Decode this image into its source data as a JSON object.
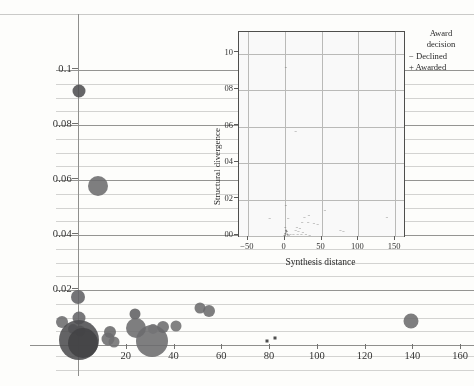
{
  "chart_data": [
    {
      "type": "scatter",
      "name": "main-bubble-chart",
      "title": "",
      "xlabel": "",
      "ylabel": "",
      "xlim": [
        -8,
        168
      ],
      "ylim": [
        0.0,
        0.104
      ],
      "grid": true,
      "xticks": [
        20,
        40,
        60,
        80,
        100,
        120,
        140,
        160
      ],
      "yticks": [
        0.02,
        0.04,
        0.06,
        0.08,
        0.1
      ],
      "ytick_labels": [
        "0.02",
        "0.04",
        "0.06",
        "0.08",
        "0.1"
      ],
      "xtick_labels": [
        "20",
        "40",
        "60",
        "80",
        "100",
        "120",
        "140",
        "160"
      ],
      "bubble_color": "#6e6e70",
      "points": [
        {
          "x": 0.5,
          "y": 0.0925,
          "size": 13,
          "shade": "#4c4c4e"
        },
        {
          "x": 8.5,
          "y": 0.0578,
          "size": 20,
          "shade": "#6a6a6c"
        },
        {
          "x": 0.2,
          "y": 0.0175,
          "size": 14,
          "shade": "#5f5f62"
        },
        {
          "x": -6.5,
          "y": 0.0085,
          "size": 12,
          "shade": "#6a6a6c"
        },
        {
          "x": 0.4,
          "y": 0.0098,
          "size": 13,
          "shade": "#626265"
        },
        {
          "x": -2.0,
          "y": 0.006,
          "size": 10,
          "shade": "#6c6c6e"
        },
        {
          "x": 0.8,
          "y": 0.0052,
          "size": 11,
          "shade": "#6a6a6c"
        },
        {
          "x": 0.6,
          "y": 0.0018,
          "size": 40,
          "shade": "#4a4a4c"
        },
        {
          "x": 2.0,
          "y": 0.0006,
          "size": 30,
          "shade": "#3f3f41"
        },
        {
          "x": 13.5,
          "y": 0.0048,
          "size": 12,
          "shade": "#666668"
        },
        {
          "x": 12.5,
          "y": 0.0022,
          "size": 13,
          "shade": "#6a6a6c"
        },
        {
          "x": 15.0,
          "y": 0.001,
          "size": 11,
          "shade": "#6e6e70"
        },
        {
          "x": 24.0,
          "y": 0.0112,
          "size": 11,
          "shade": "#5d5d60"
        },
        {
          "x": 24.5,
          "y": 0.0062,
          "size": 20,
          "shade": "#6a6a6c"
        },
        {
          "x": 31.0,
          "y": 0.0015,
          "size": 32,
          "shade": "#6a6a6c"
        },
        {
          "x": 31.5,
          "y": 0.006,
          "size": 10,
          "shade": "#727274"
        },
        {
          "x": 35.5,
          "y": 0.0065,
          "size": 12,
          "shade": "#6a6a6c"
        },
        {
          "x": 41.0,
          "y": 0.0068,
          "size": 11,
          "shade": "#6e6e70"
        },
        {
          "x": 51.0,
          "y": 0.0136,
          "size": 11,
          "shade": "#6a6a6c"
        },
        {
          "x": 55.0,
          "y": 0.0125,
          "size": 12,
          "shade": "#6a6a6c"
        },
        {
          "x": 139.5,
          "y": 0.0088,
          "size": 15,
          "shade": "#6a6a6c"
        }
      ],
      "small_markers": [
        {
          "x": 79.0,
          "y": 0.0014
        },
        {
          "x": 82.5,
          "y": 0.0025
        }
      ]
    },
    {
      "type": "scatter",
      "name": "inset-scatter",
      "title": "",
      "xlabel": "Synthesis distance",
      "ylabel": "Structural divergence",
      "xlim": [
        -62,
        162
      ],
      "ylim": [
        0.0,
        0.0112
      ],
      "grid": true,
      "xticks": [
        -50,
        0,
        50,
        100,
        150
      ],
      "xtick_labels": [
        "−50",
        "0",
        "50",
        "100",
        "150"
      ],
      "yticks": [
        0.0,
        0.002,
        0.004,
        0.006,
        0.008,
        0.01
      ],
      "ytick_labels": [
        "00",
        "02",
        "04",
        "06",
        "08",
        "10"
      ],
      "points": [
        {
          "x": 2,
          "y": 0.0092,
          "mark": "−"
        },
        {
          "x": 15,
          "y": 0.00573,
          "mark": "−"
        },
        {
          "x": 2,
          "y": 0.00166,
          "mark": "−"
        },
        {
          "x": 55,
          "y": 0.00136,
          "mark": "−"
        },
        {
          "x": 33,
          "y": 0.00112,
          "mark": "−"
        },
        {
          "x": -20,
          "y": 0.00094,
          "mark": "−"
        },
        {
          "x": 139,
          "y": 0.001,
          "mark": "−"
        },
        {
          "x": 5,
          "y": 0.00094,
          "mark": "−"
        },
        {
          "x": 27,
          "y": 0.001,
          "mark": "−"
        },
        {
          "x": 24,
          "y": 0.00074,
          "mark": "−"
        },
        {
          "x": 32,
          "y": 0.00072,
          "mark": "−"
        },
        {
          "x": 40,
          "y": 0.00066,
          "mark": "−"
        },
        {
          "x": 45,
          "y": 0.00062,
          "mark": "−"
        },
        {
          "x": 1,
          "y": 0.00046,
          "mark": "−"
        },
        {
          "x": 17,
          "y": 0.00044,
          "mark": "−"
        },
        {
          "x": 21,
          "y": 0.0004,
          "mark": "−"
        },
        {
          "x": 2,
          "y": 0.0003,
          "mark": "+"
        },
        {
          "x": 3,
          "y": 0.00022,
          "mark": "+"
        },
        {
          "x": 15,
          "y": 0.00026,
          "mark": "−"
        },
        {
          "x": 19,
          "y": 0.0002,
          "mark": "−"
        },
        {
          "x": 25,
          "y": 0.00018,
          "mark": "−"
        },
        {
          "x": 76,
          "y": 0.00026,
          "mark": "−"
        },
        {
          "x": 80,
          "y": 0.0002,
          "mark": "−"
        },
        {
          "x": 1,
          "y": 0.00012,
          "mark": "+"
        },
        {
          "x": 4,
          "y": 8e-05,
          "mark": "+"
        },
        {
          "x": 8,
          "y": 6e-05,
          "mark": "−"
        },
        {
          "x": 12,
          "y": 6e-05,
          "mark": "−"
        },
        {
          "x": 18,
          "y": 4e-05,
          "mark": "−"
        },
        {
          "x": 23,
          "y": 4e-05,
          "mark": "−"
        },
        {
          "x": 29,
          "y": 4e-05,
          "mark": "−"
        },
        {
          "x": 0,
          "y": 2e-05,
          "mark": "+"
        },
        {
          "x": 6,
          "y": 2e-05,
          "mark": "−"
        },
        {
          "x": 34,
          "y": 2e-05,
          "mark": "−"
        }
      ]
    }
  ],
  "legend": {
    "title_line1": "Award",
    "title_line2": "decision",
    "entries": [
      {
        "symbol": "−",
        "label": "Declined"
      },
      {
        "symbol": "+",
        "label": "Awarded"
      }
    ]
  },
  "inset": {
    "xlabel": "Synthesis distance",
    "ylabel": "Structural divergence"
  }
}
